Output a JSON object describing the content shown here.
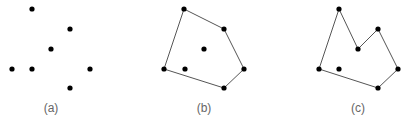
{
  "figure": {
    "panels": [
      {
        "id": "a",
        "label": "(a)",
        "label_pos": [
          51,
          112
        ],
        "points": [
          [
            32,
            9
          ],
          [
            70,
            29
          ],
          [
            51,
            49
          ],
          [
            12,
            69
          ],
          [
            32,
            69
          ],
          [
            90,
            69
          ],
          [
            70,
            88
          ]
        ],
        "polygon": []
      },
      {
        "id": "b",
        "label": "(b)",
        "label_pos": [
          204,
          112
        ],
        "points": [
          [
            184,
            9
          ],
          [
            224,
            29
          ],
          [
            204,
            49
          ],
          [
            164,
            69
          ],
          [
            185,
            69
          ],
          [
            244,
            69
          ],
          [
            224,
            88
          ]
        ],
        "polygon": [
          [
            184,
            9
          ],
          [
            224,
            29
          ],
          [
            244,
            69
          ],
          [
            224,
            88
          ],
          [
            164,
            69
          ]
        ]
      },
      {
        "id": "c",
        "label": "(c)",
        "label_pos": [
          358,
          112
        ],
        "points": [
          [
            339,
            9
          ],
          [
            378,
            29
          ],
          [
            358,
            49
          ],
          [
            319,
            69
          ],
          [
            339,
            69
          ],
          [
            398,
            69
          ],
          [
            378,
            88
          ]
        ],
        "polygon": [
          [
            339,
            9
          ],
          [
            358,
            49
          ],
          [
            378,
            29
          ],
          [
            398,
            69
          ],
          [
            378,
            88
          ],
          [
            319,
            69
          ]
        ]
      }
    ]
  },
  "style": {
    "point_color": "#000000",
    "edge_color": "#555555",
    "label_color": "#666666"
  }
}
